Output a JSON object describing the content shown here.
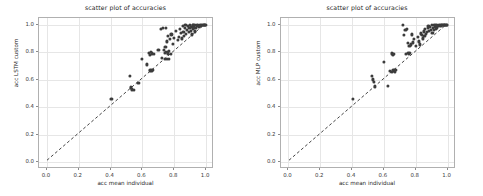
{
  "figure": {
    "background": "#ffffff",
    "point_color": "#3c3c3c",
    "grid_color": "#e6e6e6",
    "axis_color": "#b0b0b0"
  },
  "chart_data": [
    {
      "type": "scatter",
      "title": "scatter plot of accuracies",
      "xlabel": "acc mean individual",
      "ylabel": "acc LSTM custom",
      "xlim": [
        -0.05,
        1.05
      ],
      "ylim": [
        -0.05,
        1.05
      ],
      "xticks": [
        "0.0",
        "0.2",
        "0.4",
        "0.6",
        "0.8",
        "1.0"
      ],
      "xtick_values": [
        0.0,
        0.2,
        0.4,
        0.6,
        0.8,
        1.0
      ],
      "yticks": [
        "0.0",
        "0.2",
        "0.4",
        "0.6",
        "0.8",
        "1.0"
      ],
      "ytick_values": [
        0.0,
        0.2,
        0.4,
        0.6,
        0.8,
        1.0
      ],
      "grid": true,
      "legend": "none",
      "reference_line": {
        "style": "dashed",
        "from": [
          0.0,
          0.0
        ],
        "to": [
          1.0,
          1.0
        ],
        "color": "#2b2b2b"
      },
      "x": [
        0.405,
        0.52,
        0.528,
        0.535,
        0.545,
        0.575,
        0.595,
        0.628,
        0.64,
        0.645,
        0.65,
        0.655,
        0.66,
        0.662,
        0.668,
        0.672,
        0.7,
        0.715,
        0.722,
        0.73,
        0.735,
        0.74,
        0.742,
        0.745,
        0.748,
        0.75,
        0.752,
        0.755,
        0.758,
        0.76,
        0.762,
        0.765,
        0.768,
        0.772,
        0.778,
        0.782,
        0.79,
        0.8,
        0.812,
        0.822,
        0.83,
        0.838,
        0.842,
        0.848,
        0.852,
        0.858,
        0.862,
        0.866,
        0.87,
        0.875,
        0.88,
        0.885,
        0.89,
        0.895,
        0.9,
        0.905,
        0.908,
        0.912,
        0.915,
        0.918,
        0.92,
        0.925,
        0.928,
        0.932,
        0.935,
        0.94,
        0.945,
        0.95,
        0.955,
        0.96,
        0.965,
        0.97,
        0.975,
        0.98,
        0.985,
        0.99,
        0.995,
        0.998
      ],
      "y": [
        0.458,
        0.628,
        0.545,
        0.53,
        0.528,
        0.578,
        0.752,
        0.712,
        0.795,
        0.782,
        0.668,
        0.805,
        0.668,
        0.792,
        0.67,
        0.788,
        0.818,
        0.972,
        0.76,
        0.975,
        0.818,
        0.795,
        0.752,
        0.838,
        0.802,
        0.975,
        0.752,
        0.88,
        0.788,
        0.8,
        0.922,
        0.75,
        0.812,
        0.9,
        0.788,
        0.93,
        0.862,
        0.905,
        0.958,
        0.888,
        0.912,
        0.972,
        0.942,
        0.902,
        0.995,
        0.95,
        0.92,
        0.975,
        0.998,
        0.935,
        0.962,
        0.99,
        0.948,
        0.978,
        0.998,
        0.958,
        0.988,
        0.93,
        0.998,
        0.968,
        0.998,
        0.982,
        0.952,
        0.998,
        0.975,
        0.998,
        0.99,
        0.998,
        0.985,
        0.998,
        0.995,
        0.998,
        0.998,
        0.998,
        0.998,
        0.998,
        0.998,
        0.998
      ]
    },
    {
      "type": "scatter",
      "title": "scatter plot of accuracies",
      "xlabel": "acc mean individual",
      "ylabel": "acc MLP custom",
      "xlim": [
        -0.05,
        1.05
      ],
      "ylim": [
        -0.05,
        1.05
      ],
      "xticks": [
        "0.0",
        "0.2",
        "0.4",
        "0.6",
        "0.8",
        "1.0"
      ],
      "xtick_values": [
        0.0,
        0.2,
        0.4,
        0.6,
        0.8,
        1.0
      ],
      "yticks": [
        "0.0",
        "0.2",
        "0.4",
        "0.6",
        "0.8",
        "1.0"
      ],
      "ytick_values": [
        0.0,
        0.2,
        0.4,
        0.6,
        0.8,
        1.0
      ],
      "grid": true,
      "legend": "none",
      "reference_line": {
        "style": "dashed",
        "from": [
          0.0,
          0.0
        ],
        "to": [
          1.0,
          1.0
        ],
        "color": "#2b2b2b"
      },
      "x": [
        0.405,
        0.522,
        0.53,
        0.538,
        0.545,
        0.6,
        0.625,
        0.64,
        0.648,
        0.652,
        0.656,
        0.66,
        0.665,
        0.67,
        0.672,
        0.72,
        0.728,
        0.735,
        0.74,
        0.745,
        0.75,
        0.752,
        0.755,
        0.76,
        0.765,
        0.77,
        0.778,
        0.782,
        0.79,
        0.8,
        0.812,
        0.82,
        0.828,
        0.835,
        0.84,
        0.845,
        0.85,
        0.855,
        0.86,
        0.865,
        0.87,
        0.875,
        0.88,
        0.885,
        0.89,
        0.895,
        0.9,
        0.905,
        0.908,
        0.912,
        0.915,
        0.918,
        0.92,
        0.925,
        0.928,
        0.932,
        0.935,
        0.94,
        0.945,
        0.95,
        0.955,
        0.958,
        0.962,
        0.966,
        0.97,
        0.975,
        0.98,
        0.985,
        0.99,
        0.995,
        0.998
      ],
      "y": [
        0.458,
        0.63,
        0.602,
        0.585,
        0.552,
        0.732,
        0.558,
        0.662,
        0.792,
        0.66,
        0.785,
        0.668,
        0.79,
        0.658,
        0.672,
        0.998,
        0.928,
        0.962,
        0.79,
        0.972,
        0.795,
        0.868,
        0.792,
        0.845,
        0.798,
        0.858,
        0.93,
        0.872,
        0.9,
        0.848,
        0.912,
        0.88,
        0.858,
        0.938,
        0.925,
        0.902,
        0.952,
        0.922,
        0.968,
        0.935,
        0.948,
        0.975,
        0.99,
        0.958,
        0.985,
        0.965,
        0.998,
        0.942,
        0.978,
        0.998,
        0.962,
        0.988,
        0.998,
        0.972,
        0.998,
        0.982,
        0.998,
        0.992,
        0.998,
        0.998,
        0.995,
        0.998,
        0.998,
        0.998,
        0.998,
        0.998,
        0.998,
        0.998,
        0.998,
        0.998,
        0.998
      ]
    }
  ]
}
